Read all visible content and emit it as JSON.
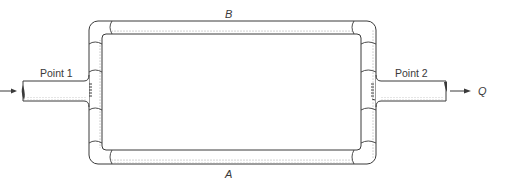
{
  "diagram": {
    "labels": {
      "point1": "Point 1",
      "point2": "Point 2",
      "branch_top": "B",
      "branch_bottom": "A",
      "flow": "Q"
    },
    "colors": {
      "line": "#3a3a3a",
      "shade": "#d4d4d4",
      "background": "#ffffff"
    }
  }
}
